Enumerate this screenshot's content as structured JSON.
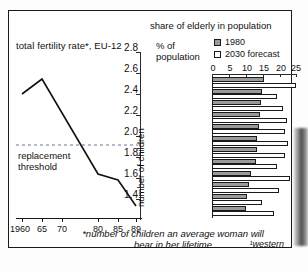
{
  "line_chart": {
    "title": "total fertility rate*, EU-12",
    "y_axis_label": "number of children",
    "replacement_label_line1": "replacement",
    "replacement_label_line2": "threshold",
    "replacement_value": 2.1,
    "x_ticks": [
      "1960",
      "65",
      "70",
      "80",
      "85",
      "89"
    ],
    "y_ticks": [
      "2.8",
      "2.6",
      "2.4",
      "2.2",
      "2.0",
      "1.8",
      "1.6",
      "1.4"
    ]
  },
  "bar_chart": {
    "header": "share of elderly in population",
    "axis_label_line1": "% of",
    "axis_label_line2": "population",
    "legend": [
      {
        "label": "1980",
        "color": "#9a9a9a"
      },
      {
        "label": "2030  forecast",
        "color": "#ffffff"
      }
    ],
    "x_ticks": [
      "0",
      "5",
      "10",
      "15",
      "20",
      "25"
    ]
  },
  "footnote": {
    "line1": "*number of children an average woman will",
    "line2": "bear in her lifetime",
    "western": "¹western"
  },
  "chart_data": [
    {
      "type": "line",
      "title": "total fertility rate*, EU-12",
      "xlabel": "",
      "ylabel": "number of children",
      "xlim": [
        1960,
        1989
      ],
      "ylim": [
        1.3,
        2.85
      ],
      "grid": false,
      "x": [
        1960,
        1965,
        1980,
        1985,
        1989
      ],
      "values": [
        2.6,
        2.72,
        1.82,
        1.78,
        1.55
      ],
      "xtick_labels": [
        "1960",
        "65",
        "70",
        "80",
        "85",
        "89"
      ],
      "xtick_values": [
        1960,
        1965,
        1970,
        1980,
        1985,
        1989
      ],
      "ytick_values": [
        2.8,
        2.6,
        2.4,
        2.2,
        2.0,
        1.8,
        1.6,
        1.4
      ],
      "annotations": [
        {
          "text": "replacement threshold",
          "y": 2.1,
          "style": "dashed-horizontal-line"
        }
      ]
    },
    {
      "type": "bar",
      "orientation": "horizontal",
      "title": "share of elderly in population",
      "xlabel": "% of population",
      "ylabel": "",
      "xlim": [
        0,
        25
      ],
      "grid": false,
      "legend_position": "top-right",
      "categories": [
        "Gemany¹",
        "Britain",
        "Belgium",
        "Denmark",
        "France",
        "Italy",
        "Luxembourg",
        "Greece",
        "Holland",
        "Spain",
        "Iceland",
        "Portugal"
      ],
      "series": [
        {
          "name": "1980",
          "color": "#9a9a9a",
          "values": [
            15.5,
            15.0,
            14.6,
            14.4,
            14.0,
            13.5,
            13.4,
            13.0,
            11.5,
            11.0,
            10.5,
            10.2
          ]
        },
        {
          "name": "2030  forecast",
          "color": "#ffffff",
          "values": [
            25.0,
            19.2,
            21.0,
            22.4,
            21.8,
            22.6,
            21.6,
            19.4,
            23.2,
            20.0,
            15.0,
            18.6
          ]
        }
      ]
    }
  ]
}
